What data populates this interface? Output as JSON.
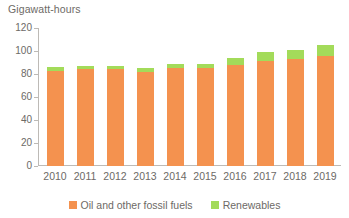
{
  "chart_data": {
    "type": "bar",
    "stacked": true,
    "title": "",
    "subtitle": "",
    "ylabel": "Gigawatt-hours",
    "xlabel": "",
    "categories": [
      "2010",
      "2011",
      "2012",
      "2013",
      "2014",
      "2015",
      "2016",
      "2017",
      "2018",
      "2019"
    ],
    "series": [
      {
        "name": "Oil and other fossil fuels",
        "color": "#f4924f",
        "values": [
          83,
          84,
          84,
          82,
          85,
          85,
          88,
          91,
          93,
          96
        ]
      },
      {
        "name": "Renewables",
        "color": "#a3db5a",
        "values": [
          3,
          3,
          3,
          3,
          4,
          4,
          6,
          8,
          8,
          9
        ]
      }
    ],
    "totals": [
      86,
      87,
      87,
      85,
      89,
      89,
      94,
      99,
      101,
      105
    ],
    "ylim": [
      0,
      120
    ],
    "yticks": [
      0,
      20,
      40,
      60,
      80,
      100,
      120
    ],
    "ytick_labels": [
      "0",
      "20",
      "40",
      "60",
      "80",
      "100",
      "120"
    ],
    "grid": false,
    "legend_position": "bottom"
  },
  "legend": {
    "items": [
      {
        "label": "Oil and other fossil fuels",
        "color": "#f4924f"
      },
      {
        "label": "Renewables",
        "color": "#a3db5a"
      }
    ]
  },
  "colors": {
    "fossil": "#f4924f",
    "renewables": "#a3db5a",
    "axis": "#bdbab6",
    "text": "#6d6a66",
    "background": "#ffffff"
  }
}
